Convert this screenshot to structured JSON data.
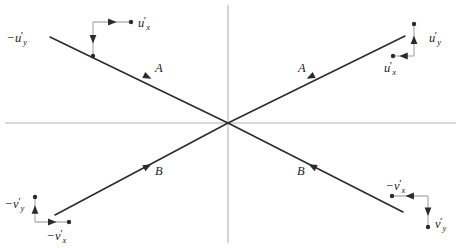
{
  "figure": {
    "type": "vector-component-diagram",
    "background_color": "#ffffff",
    "axis_color": "#b4b4b4",
    "ray_color": "#2b2b2b",
    "label_color": "#1a1a1a",
    "origin": {
      "x": 228,
      "y": 123
    }
  },
  "axes": {
    "horizontal": {
      "name": "horizontal-axis",
      "x1": 5,
      "y1": 123,
      "x2": 456,
      "y2": 123
    },
    "vertical": {
      "name": "vertical-axis",
      "x1": 228,
      "y1": 5,
      "x2": 228,
      "y2": 243
    }
  },
  "rays": [
    {
      "id": "ray-upper-left",
      "label": "A",
      "label_x": 155,
      "label_y": 62,
      "from": {
        "x": 50,
        "y": 37
      },
      "to": {
        "x": 228,
        "y": 123
      },
      "arrow_at": {
        "x": 148,
        "y": 77
      },
      "arrow_direction": "down-right",
      "points_toward": "origin"
    },
    {
      "id": "ray-upper-right",
      "label": "A",
      "label_x": 298,
      "label_y": 62,
      "from": {
        "x": 405,
        "y": 36
      },
      "to": {
        "x": 228,
        "y": 123
      },
      "arrow_at": {
        "x": 310,
        "y": 77
      },
      "arrow_direction": "down-left",
      "points_toward": "origin"
    },
    {
      "id": "ray-lower-left",
      "label": "B",
      "label_x": 155,
      "label_y": 165,
      "from": {
        "x": 55,
        "y": 215
      },
      "to": {
        "x": 228,
        "y": 123
      },
      "arrow_at": {
        "x": 148,
        "y": 166
      },
      "arrow_direction": "up-right",
      "points_toward": "origin"
    },
    {
      "id": "ray-lower-right",
      "label": "B",
      "label_x": 297,
      "label_y": 165,
      "from": {
        "x": 403,
        "y": 212
      },
      "to": {
        "x": 228,
        "y": 123
      },
      "arrow_at": {
        "x": 312,
        "y": 166
      },
      "arrow_direction": "up-left",
      "points_toward": "origin"
    }
  ],
  "component_frames": [
    {
      "id": "frame-top-left",
      "corner_x": 93,
      "corner_y": 22,
      "x_component": {
        "name": "u-prime-x",
        "sign": "",
        "symbol": "u",
        "subscript": "x",
        "prime": true,
        "direction": "right",
        "tip_x": 131,
        "tip_y": 22,
        "label_x": 138,
        "label_y": 15
      },
      "y_component": {
        "name": "minus-u-prime-y",
        "sign": "−",
        "symbol": "u",
        "subscript": "y",
        "prime": true,
        "direction": "down",
        "tip_x": 93,
        "tip_y": 56,
        "label_x": 7,
        "label_y": 30
      }
    },
    {
      "id": "frame-top-right",
      "corner_x": 414,
      "corner_y": 56,
      "x_component": {
        "name": "u-prime-x",
        "sign": "",
        "symbol": "u",
        "subscript": "x",
        "prime": true,
        "direction": "left",
        "tip_x": 393,
        "tip_y": 56,
        "label_x": 384,
        "label_y": 60
      },
      "y_component": {
        "name": "u-prime-y",
        "sign": "",
        "symbol": "u",
        "subscript": "y",
        "prime": true,
        "direction": "up",
        "tip_x": 414,
        "tip_y": 24,
        "label_x": 429,
        "label_y": 30
      }
    },
    {
      "id": "frame-bottom-left",
      "corner_x": 35,
      "corner_y": 222,
      "x_component": {
        "name": "minus-v-prime-x",
        "sign": "−",
        "symbol": "v",
        "subscript": "x",
        "prime": true,
        "direction": "right",
        "tip_x": 69,
        "tip_y": 222,
        "label_x": 47,
        "label_y": 228
      },
      "y_component": {
        "name": "minus-v-prime-y",
        "sign": "−",
        "symbol": "v",
        "subscript": "y",
        "prime": true,
        "direction": "up",
        "tip_x": 35,
        "tip_y": 197,
        "label_x": 5,
        "label_y": 196
      }
    },
    {
      "id": "frame-bottom-right",
      "corner_x": 428,
      "corner_y": 196,
      "x_component": {
        "name": "minus-v-prime-x",
        "sign": "−",
        "symbol": "v",
        "subscript": "x",
        "prime": true,
        "direction": "left",
        "tip_x": 392,
        "tip_y": 196,
        "label_x": 386,
        "label_y": 178
      },
      "y_component": {
        "name": "v-prime-y",
        "sign": "",
        "symbol": "v",
        "subscript": "y",
        "prime": true,
        "direction": "down",
        "tip_x": 428,
        "tip_y": 227,
        "label_x": 435,
        "label_y": 216
      }
    }
  ]
}
